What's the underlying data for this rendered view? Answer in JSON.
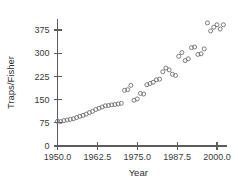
{
  "chart_data": {
    "type": "scatter",
    "title": "",
    "xlabel": "Year",
    "ylabel": "Traps/Fisher",
    "xlim": [
      1948.5,
      2003.0
    ],
    "ylim": [
      0,
      410
    ],
    "xticks": [
      1950.0,
      1962.5,
      1975.0,
      1987.5,
      2000.0
    ],
    "xticklabels": [
      "1950.0",
      "1962.5",
      "1975.0",
      "1987.5",
      "2000.0"
    ],
    "yticks": [
      0,
      75,
      150,
      225,
      300,
      375
    ],
    "yticklabels": [
      "0",
      "75",
      "150",
      "225",
      "300",
      "375"
    ],
    "grid": false,
    "legend": null,
    "marker": "open-circle",
    "marker_color": "#6e6e6e",
    "x": [
      1950,
      1951,
      1952,
      1953,
      1954,
      1955,
      1956,
      1957,
      1958,
      1959,
      1960,
      1961,
      1962,
      1963,
      1964,
      1965,
      1966,
      1967,
      1968,
      1969,
      1970,
      1971,
      1972,
      1973,
      1974,
      1975,
      1976,
      1977,
      1978,
      1979,
      1980,
      1981,
      1982,
      1983,
      1984,
      1985,
      1986,
      1987,
      1988,
      1989,
      1990,
      1991,
      1992,
      1993,
      1994,
      1995,
      1996,
      1997,
      1998,
      1999,
      2000,
      2001,
      2002
    ],
    "y": [
      80,
      79,
      82,
      84,
      86,
      88,
      92,
      96,
      99,
      103,
      108,
      112,
      118,
      122,
      126,
      130,
      131,
      133,
      134,
      136,
      138,
      180,
      182,
      196,
      148,
      152,
      170,
      168,
      198,
      202,
      206,
      214,
      216,
      240,
      252,
      246,
      232,
      228,
      290,
      302,
      276,
      282,
      318,
      320,
      296,
      298,
      314,
      398,
      372,
      384,
      392,
      378,
      392
    ]
  }
}
